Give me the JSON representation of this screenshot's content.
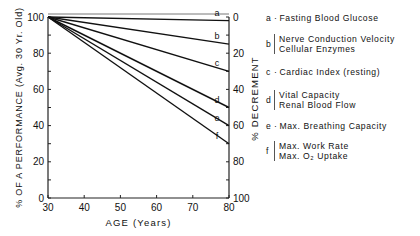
{
  "chart_data": {
    "type": "line",
    "title": "",
    "xlabel": "AGE (Years)",
    "ylabel": "% OF A PERFORMANCE (Avg. 30 Yr. Old)",
    "ylabel_right": "% DECREMENT",
    "xlim": [
      30,
      80
    ],
    "ylim": [
      0,
      100
    ],
    "x_ticks": [
      30,
      40,
      50,
      60,
      70,
      80
    ],
    "y_ticks": [
      0,
      20,
      40,
      60,
      80,
      100
    ],
    "y_right_ticks": [
      100,
      80,
      60,
      40,
      20,
      0
    ],
    "grid": false,
    "x": [
      30,
      80
    ],
    "series": [
      {
        "name": "a",
        "label": "Fasting Blood Glucose",
        "values": [
          100,
          98
        ]
      },
      {
        "name": "b",
        "label": "Nerve Conduction Velocity / Cellular Enzymes",
        "values": [
          100,
          85
        ]
      },
      {
        "name": "c",
        "label": "Cardiac Index (resting)",
        "values": [
          100,
          70
        ]
      },
      {
        "name": "d",
        "label": "Vital Capacity / Renal Blood Flow",
        "values": [
          100,
          50
        ]
      },
      {
        "name": "e",
        "label": "Max. Breathing Capacity",
        "values": [
          100,
          40
        ]
      },
      {
        "name": "f",
        "label": "Max. Work Rate / Max. O2 Uptake",
        "values": [
          100,
          30
        ]
      }
    ],
    "legend_position": "right"
  },
  "legend": [
    {
      "key": "a",
      "lines": [
        "Fasting Blood Glucose"
      ],
      "bracket": false
    },
    {
      "key": "b",
      "lines": [
        "Nerve Conduction Velocity",
        "Cellular Enzymes"
      ],
      "bracket": true
    },
    {
      "key": "c",
      "lines": [
        "Cardiac Index (resting)"
      ],
      "bracket": false
    },
    {
      "key": "d",
      "lines": [
        "Vital Capacity",
        "Renal Blood Flow"
      ],
      "bracket": true
    },
    {
      "key": "e",
      "lines": [
        "Max. Breathing Capacity"
      ],
      "bracket": false
    },
    {
      "key": "f",
      "lines": [
        "Max. Work Rate",
        "Max. O₂ Uptake"
      ],
      "bracket": true
    }
  ]
}
